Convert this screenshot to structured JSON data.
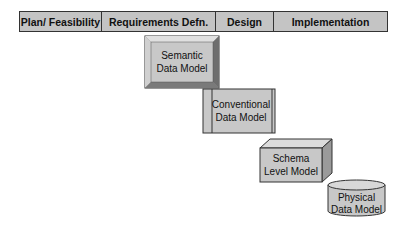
{
  "phases": [
    {
      "label": "Plan/ Feasibility",
      "width": 82
    },
    {
      "label": "Requirements Defn.",
      "width": 114
    },
    {
      "label": "Design",
      "width": 58
    },
    {
      "label": "Implementation",
      "width": 115
    }
  ],
  "models": [
    {
      "name": "semantic",
      "line1": "Semantic",
      "line2": "Data Model",
      "shape": "bevel-box"
    },
    {
      "name": "conventional",
      "line1": "Conventional",
      "line2": "Data Model",
      "shape": "process-box"
    },
    {
      "name": "schema",
      "line1": "Schema",
      "line2": "Level Model",
      "shape": "3d-box"
    },
    {
      "name": "physical",
      "line1": "Physical",
      "line2": "Data Model",
      "shape": "cylinder"
    }
  ],
  "colors": {
    "fill": "#c8c8c8",
    "dark": "#8a8a8a",
    "light": "#e4e4e4",
    "stroke": "#333333"
  }
}
